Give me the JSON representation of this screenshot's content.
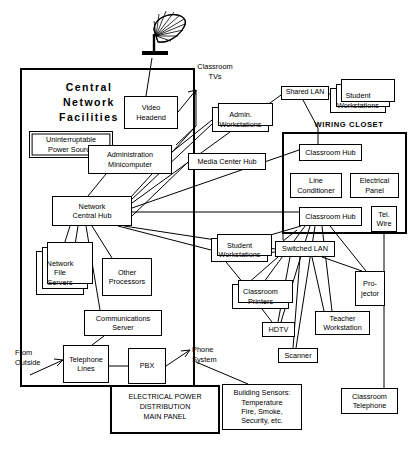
{
  "diagram": {
    "type": "network-topology-diagram",
    "regions": [
      {
        "id": "central-network-facilities",
        "label": "Central\nNetwork\nFacilities",
        "x": 20,
        "y": 68,
        "w": 175,
        "h": 319
      },
      {
        "id": "wiring-closet",
        "label": "WIRING  CLOSET",
        "x": 282,
        "y": 132,
        "w": 125,
        "h": 102
      },
      {
        "id": "electrical-power-panel",
        "label": "ELECTRICAL POWER\nDISTRIBUTION\nMAIN PANEL",
        "x": 110,
        "y": 385,
        "w": 110,
        "h": 49
      }
    ],
    "nodes": [
      {
        "id": "video-headend",
        "label": "Video\nHeadend",
        "x": 124,
        "y": 96,
        "w": 54,
        "h": 33,
        "stack": 0
      },
      {
        "id": "ups",
        "label": "Uninterruptable\nPower Source",
        "x": 29,
        "y": 131,
        "w": 84,
        "h": 27,
        "stack": 0,
        "style": "dbl"
      },
      {
        "id": "administration-minicomputer",
        "label": "Administration\nMinicomputer",
        "x": 88,
        "y": 145,
        "w": 84,
        "h": 29,
        "stack": 0
      },
      {
        "id": "network-central-hub",
        "label": "Network\nCentral Hub",
        "x": 52,
        "y": 196,
        "w": 80,
        "h": 30,
        "stack": 0
      },
      {
        "id": "network-file-servers",
        "label": "Network\nFile\nServers",
        "x": 36,
        "y": 251,
        "w": 48,
        "h": 44,
        "stack": 3
      },
      {
        "id": "other-processors",
        "label": "Other\nProcessors",
        "x": 102,
        "y": 258,
        "w": 50,
        "h": 38,
        "stack": 0
      },
      {
        "id": "communications-server",
        "label": "Communications\nServer",
        "x": 84,
        "y": 310,
        "w": 78,
        "h": 26,
        "stack": 0
      },
      {
        "id": "telephone-lines",
        "label": "Telephone\nLines",
        "x": 63,
        "y": 345,
        "w": 46,
        "h": 38,
        "stack": 0
      },
      {
        "id": "pbx",
        "label": "PBX",
        "x": 128,
        "y": 348,
        "w": 38,
        "h": 36,
        "stack": 0
      },
      {
        "id": "admin-workstations",
        "label": "Admin.\nWorkstations",
        "x": 212,
        "y": 107,
        "w": 57,
        "h": 25,
        "stack": 2
      },
      {
        "id": "media-center-hub",
        "label": "Media Center Hub",
        "x": 188,
        "y": 153,
        "w": 78,
        "h": 17,
        "stack": 0
      },
      {
        "id": "shared-lan",
        "label": "Shared LAN",
        "x": 281,
        "y": 86,
        "w": 48,
        "h": 14,
        "stack": 0
      },
      {
        "id": "student-workstations-top",
        "label": "Student\nWorkstations",
        "x": 330,
        "y": 88,
        "w": 56,
        "h": 25,
        "stack": 3
      },
      {
        "id": "classroom-hub-1",
        "label": "Classroom Hub",
        "x": 299,
        "y": 144,
        "w": 63,
        "h": 17,
        "stack": 0
      },
      {
        "id": "line-conditioner",
        "label": "Line\nConditioner",
        "x": 290,
        "y": 173,
        "w": 52,
        "h": 25,
        "stack": 0
      },
      {
        "id": "electrical-panel",
        "label": "Electrical\nPanel",
        "x": 350,
        "y": 173,
        "w": 49,
        "h": 25,
        "stack": 0
      },
      {
        "id": "classroom-hub-2",
        "label": "Classroom Hub",
        "x": 299,
        "y": 207,
        "w": 63,
        "h": 19,
        "stack": 0
      },
      {
        "id": "tel-wire",
        "label": "Tel.\nWire",
        "x": 371,
        "y": 206,
        "w": 26,
        "h": 26,
        "stack": 0
      },
      {
        "id": "student-workstations-bottom",
        "label": "Student\nWorkstations",
        "x": 211,
        "y": 238,
        "w": 57,
        "h": 24,
        "stack": 2
      },
      {
        "id": "switched-lan",
        "label": "Switched LAN",
        "x": 275,
        "y": 241,
        "w": 60,
        "h": 16,
        "stack": 0
      },
      {
        "id": "projector",
        "label": "Pro-\njector",
        "x": 355,
        "y": 271,
        "w": 30,
        "h": 35,
        "stack": 0
      },
      {
        "id": "classroom-printers",
        "label": "Classroom\nPrinters",
        "x": 232,
        "y": 284,
        "w": 57,
        "h": 25,
        "stack": 2
      },
      {
        "id": "teacher-workstation",
        "label": "Teacher\nWorkstation",
        "x": 315,
        "y": 311,
        "w": 55,
        "h": 24,
        "stack": 0
      },
      {
        "id": "hdtv",
        "label": "HDTV",
        "x": 262,
        "y": 322,
        "w": 33,
        "h": 15,
        "stack": 0
      },
      {
        "id": "scanner",
        "label": "Scanner",
        "x": 278,
        "y": 348,
        "w": 40,
        "h": 15,
        "stack": 0
      },
      {
        "id": "building-sensors",
        "label": "Building  Sensors:\nTemperature\nFire,  Smoke,\nSecurity,  etc.",
        "x": 222,
        "y": 384,
        "w": 80,
        "h": 46,
        "stack": 0
      },
      {
        "id": "classroom-telephone",
        "label": "Classroom\nTelephone",
        "x": 341,
        "y": 388,
        "w": 57,
        "h": 26,
        "stack": 0
      }
    ],
    "annotations": [
      {
        "id": "classroom-tvs-label",
        "label": "Classroom\nTVs",
        "x": 185,
        "y": 62
      },
      {
        "id": "from-outside-label",
        "label": "From\nOutside",
        "x": 19,
        "y": 348
      },
      {
        "id": "phone-system-label",
        "label": "Phone\nSystem",
        "x": 192,
        "y": 348
      }
    ],
    "icons": [
      {
        "id": "satellite-dish-icon",
        "x": 142,
        "y": 10,
        "w": 44,
        "h": 48
      }
    ]
  }
}
